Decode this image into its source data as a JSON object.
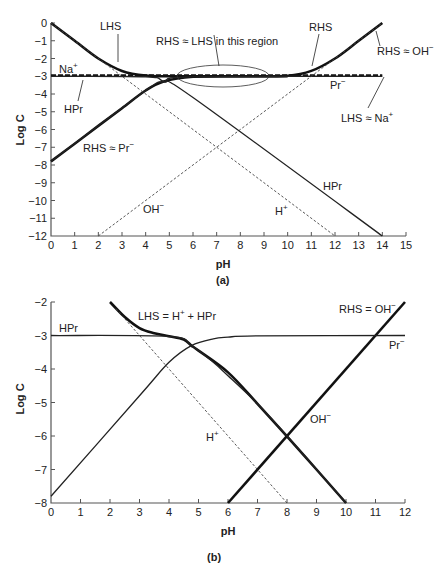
{
  "figure": {
    "panel_a_label": "(a)",
    "panel_b_label": "(b)"
  },
  "chart_data": [
    {
      "id": "a",
      "type": "line",
      "title": "",
      "xlabel": "pH",
      "ylabel": "Log C",
      "xlim": [
        0,
        15
      ],
      "ylim": [
        -12,
        0
      ],
      "xticks": [
        "0",
        "1",
        "2",
        "3",
        "4",
        "5",
        "6",
        "7",
        "8",
        "9",
        "10",
        "11",
        "12",
        "13",
        "14",
        "15"
      ],
      "yticks": [
        "0",
        "−1",
        "−2",
        "−3",
        "−4",
        "−5",
        "−6",
        "−7",
        "−8",
        "−9",
        "−10",
        "−11",
        "−12"
      ],
      "grid": false,
      "series": [
        {
          "name": "LHS (H+ + HPr)",
          "style": "thick",
          "x": [
            0,
            1,
            2,
            3,
            4,
            5,
            6,
            10
          ],
          "y": [
            0,
            -1,
            -2,
            -2.7,
            -2.96,
            -3.0,
            -3.0,
            -3.0
          ]
        },
        {
          "name": "RHS (OH- + Pr-)",
          "style": "thick",
          "x": [
            0,
            1,
            2,
            3,
            4,
            4.76,
            6,
            8,
            10,
            11,
            12,
            13,
            14
          ],
          "y": [
            -7.8,
            -6.8,
            -5.8,
            -4.8,
            -3.8,
            -3.3,
            -3.03,
            -3.0,
            -2.97,
            -2.7,
            -2.0,
            -1.0,
            0
          ]
        },
        {
          "name": "Na+",
          "style": "thick-dashed",
          "x": [
            0,
            14
          ],
          "y": [
            -2.95,
            -2.95
          ]
        },
        {
          "name": "HPr",
          "style": "thin",
          "x": [
            0,
            4,
            4.76,
            6,
            14
          ],
          "y": [
            -3.0,
            -3.03,
            -3.3,
            -4.2,
            -12
          ]
        },
        {
          "name": "Pr-",
          "style": "thin",
          "x": [
            0,
            4,
            4.76,
            6,
            14
          ],
          "y": [
            -7.8,
            -3.8,
            -3.3,
            -3.03,
            -3.0
          ]
        },
        {
          "name": "H+",
          "style": "dotted",
          "x": [
            0,
            12
          ],
          "y": [
            0,
            -12
          ]
        },
        {
          "name": "OH-",
          "style": "dotted",
          "x": [
            2,
            14
          ],
          "y": [
            -12,
            0
          ]
        }
      ],
      "annotations": [
        {
          "text": "LHS",
          "x": 2.6,
          "y": -1.0
        },
        {
          "text": "Na+",
          "x": 0.3,
          "y": -2.7
        },
        {
          "text": "HPr",
          "x": 0.8,
          "y": -4.6
        },
        {
          "text": "RHS ≈ LHS in this region",
          "x": 5.1,
          "y": -1.5
        },
        {
          "text": "RHS",
          "x": 11.5,
          "y": -1.0
        },
        {
          "text": "RHS ≈ OH−",
          "x": 13.8,
          "y": -1.6
        },
        {
          "text": "Pr−",
          "x": 12.0,
          "y": -3.6
        },
        {
          "text": "LHS ≈ Na+",
          "x": 12.7,
          "y": -5.6
        },
        {
          "text": "RHS ≈ Pr−",
          "x": 1.8,
          "y": -7.0
        },
        {
          "text": "OH−",
          "x": 3.5,
          "y": -10.2
        },
        {
          "text": "H+",
          "x": 10.5,
          "y": -10.6
        },
        {
          "text": "HPr",
          "x": 12.6,
          "y": -9.2
        }
      ]
    },
    {
      "id": "b",
      "type": "line",
      "title": "",
      "xlabel": "pH",
      "ylabel": "Log C",
      "xlim": [
        0,
        12
      ],
      "ylim": [
        -8,
        -2
      ],
      "xticks": [
        "0",
        "1",
        "2",
        "3",
        "4",
        "5",
        "6",
        "7",
        "8",
        "9",
        "10",
        "11",
        "12"
      ],
      "yticks": [
        "−2",
        "−3",
        "−4",
        "−5",
        "−6",
        "−7",
        "−8"
      ],
      "grid": false,
      "series": [
        {
          "name": "LHS = H+ + HPr",
          "style": "thick",
          "x": [
            2,
            2.5,
            3,
            3.5,
            4,
            4.5,
            4.76,
            5,
            6,
            7,
            8,
            9,
            10
          ],
          "y": [
            -2,
            -2.45,
            -2.78,
            -2.93,
            -3.02,
            -3.12,
            -3.3,
            -3.45,
            -4.1,
            -5.04,
            -6.01,
            -7.0,
            -8.0
          ]
        },
        {
          "name": "RHS = OH−",
          "style": "thick",
          "x": [
            6,
            12
          ],
          "y": [
            -8,
            -2
          ]
        },
        {
          "name": "HPr",
          "style": "thin",
          "x": [
            0,
            4,
            4.76,
            5.5,
            6,
            7,
            8,
            9,
            10
          ],
          "y": [
            -3.0,
            -3.03,
            -3.3,
            -3.8,
            -4.2,
            -5.04,
            -6.0,
            -7.0,
            -8.0
          ]
        },
        {
          "name": "Pr−",
          "style": "thin",
          "x": [
            0,
            3,
            4,
            4.76,
            5.5,
            6,
            7,
            12
          ],
          "y": [
            -7.8,
            -4.8,
            -3.8,
            -3.3,
            -3.1,
            -3.05,
            -3.01,
            -3.0
          ]
        },
        {
          "name": "H+",
          "style": "dotted",
          "x": [
            2.2,
            8
          ],
          "y": [
            -2.2,
            -8
          ]
        }
      ],
      "annotations": [
        {
          "text": "HPr",
          "x": 0.2,
          "y": -2.8
        },
        {
          "text": "LHS = H+ + HPr",
          "x": 2.9,
          "y": -2.4
        },
        {
          "text": "RHS = OH−",
          "x": 9.0,
          "y": -2.2
        },
        {
          "text": "Pr−",
          "x": 11.2,
          "y": -3.3
        },
        {
          "text": "H+",
          "x": 5.2,
          "y": -6.3
        },
        {
          "text": "OH−",
          "x": 7.0,
          "y": -5.5
        }
      ]
    }
  ],
  "labels": {
    "a": {
      "ylabel": "Log C",
      "xlabel": "pH",
      "lhs": "LHS",
      "na": "Na",
      "na_sup": "+",
      "hpr_left": "HPr",
      "region": "RHS ≈ LHS in this region",
      "rhs": "RHS",
      "rhs_oh": "RHS ≈ OH",
      "rhs_oh_sup": "−",
      "pr": "Pr",
      "pr_sup": "−",
      "lhs_na": "LHS ≈ Na",
      "lhs_na_sup": "+",
      "rhs_pr": "RHS ≈ Pr",
      "rhs_pr_sup": "−",
      "oh": "OH",
      "oh_sup": "−",
      "h": "H",
      "h_sup": "+",
      "hpr_right": "HPr"
    },
    "b": {
      "ylabel": "Log C",
      "xlabel": "pH",
      "hpr": "HPr",
      "lhs_eq": "LHS = H",
      "lhs_eq_sup": "+",
      "lhs_eq_tail": " + HPr",
      "rhs_eq": "RHS = OH",
      "rhs_eq_sup": "−",
      "pr": "Pr",
      "pr_sup": "−",
      "h": "H",
      "h_sup": "+",
      "oh": "OH",
      "oh_sup": "−"
    }
  }
}
